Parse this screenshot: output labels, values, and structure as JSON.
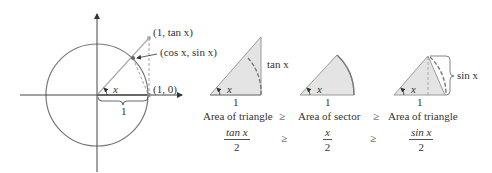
{
  "unit_circle": {
    "point_tan_label": "(1, tan x)",
    "point_cos_sin_label": "(cos x, sin x)",
    "point_one_zero_label": "(1, 0)",
    "angle_label": "x",
    "radius_label": "1"
  },
  "panels": [
    {
      "name": "triangle-large",
      "angle_label": "x",
      "base_label": "1",
      "side_label": "tan x",
      "caption": "Area of triangle",
      "formula_num": "tan x",
      "formula_den": "2"
    },
    {
      "name": "sector",
      "angle_label": "x",
      "base_label": "1",
      "caption": "Area of sector",
      "formula_num": "x",
      "formula_den": "2"
    },
    {
      "name": "triangle-small",
      "angle_label": "x",
      "base_label": "1",
      "side_label": "sin x",
      "caption": "Area of triangle",
      "formula_num": "sin x",
      "formula_den": "2"
    }
  ],
  "relations": {
    "caption_geq_1": "≥",
    "caption_geq_2": "≥",
    "formula_geq_1": "≥",
    "formula_geq_2": "≥"
  },
  "colors": {
    "fill": "#e4e4e4",
    "stroke": "#9a9a9a",
    "line": "#555555"
  }
}
